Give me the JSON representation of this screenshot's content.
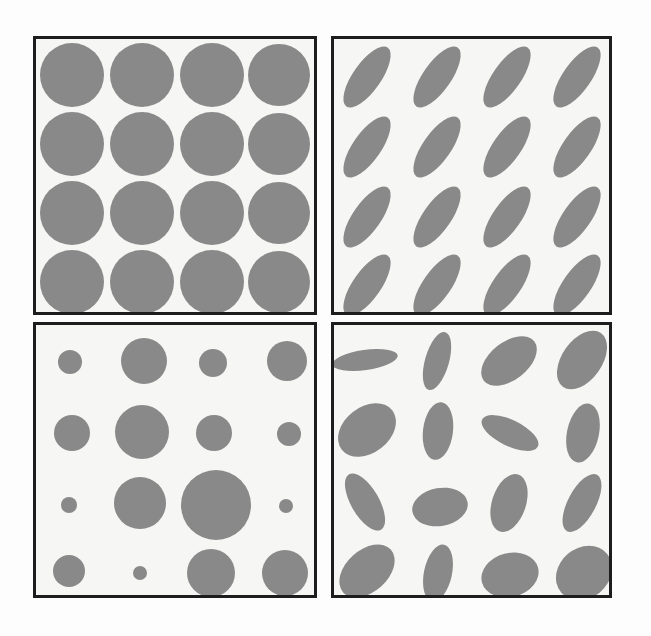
{
  "figure": {
    "width": 651,
    "height": 636,
    "page_background": "#fdfdfd",
    "panel_background": "#f6f6f4",
    "panel_border_color": "#1d1d1d",
    "panel_border_width": 3,
    "shape_fill": "#898989"
  },
  "panels": [
    {
      "id": "panel-uniform-circles",
      "label": "Uniform circles",
      "position": "top-left",
      "x": 33,
      "y": 36,
      "width": 284,
      "height": 279,
      "shape_type": "circle",
      "variation": "none",
      "rows": 4,
      "cols": 4,
      "count": 16,
      "shapes": [
        {
          "cx": 36,
          "cy": 36,
          "rx": 32,
          "ry": 32,
          "angle": 0
        },
        {
          "cx": 106,
          "cy": 36,
          "rx": 32,
          "ry": 32,
          "angle": 0
        },
        {
          "cx": 176,
          "cy": 36,
          "rx": 32,
          "ry": 32,
          "angle": 0
        },
        {
          "cx": 243,
          "cy": 36,
          "rx": 31,
          "ry": 31,
          "angle": 0
        },
        {
          "cx": 36,
          "cy": 105,
          "rx": 32,
          "ry": 32,
          "angle": 0
        },
        {
          "cx": 106,
          "cy": 105,
          "rx": 32,
          "ry": 32,
          "angle": 0
        },
        {
          "cx": 176,
          "cy": 105,
          "rx": 32,
          "ry": 32,
          "angle": 0
        },
        {
          "cx": 243,
          "cy": 105,
          "rx": 31,
          "ry": 31,
          "angle": 0
        },
        {
          "cx": 36,
          "cy": 174,
          "rx": 32,
          "ry": 32,
          "angle": 0
        },
        {
          "cx": 106,
          "cy": 174,
          "rx": 32,
          "ry": 32,
          "angle": 0
        },
        {
          "cx": 176,
          "cy": 174,
          "rx": 32,
          "ry": 32,
          "angle": 0
        },
        {
          "cx": 243,
          "cy": 174,
          "rx": 31,
          "ry": 31,
          "angle": 0
        },
        {
          "cx": 36,
          "cy": 243,
          "rx": 32,
          "ry": 32,
          "angle": 0
        },
        {
          "cx": 106,
          "cy": 243,
          "rx": 32,
          "ry": 32,
          "angle": 0
        },
        {
          "cx": 176,
          "cy": 243,
          "rx": 32,
          "ry": 32,
          "angle": 0
        },
        {
          "cx": 243,
          "cy": 243,
          "rx": 31,
          "ry": 31,
          "angle": 0
        }
      ]
    },
    {
      "id": "panel-uniform-ellipses",
      "label": "Uniform ellipses, common orientation",
      "position": "top-right",
      "x": 331,
      "y": 36,
      "width": 281,
      "height": 279,
      "shape_type": "ellipse",
      "variation": "none",
      "rows": 4,
      "cols": 4,
      "count": 16,
      "common_angle": -55,
      "shapes": [
        {
          "cx": 33,
          "cy": 38,
          "rx": 36,
          "ry": 14,
          "angle": -55
        },
        {
          "cx": 103,
          "cy": 38,
          "rx": 36,
          "ry": 14,
          "angle": -55
        },
        {
          "cx": 173,
          "cy": 38,
          "rx": 36,
          "ry": 14,
          "angle": -55
        },
        {
          "cx": 243,
          "cy": 38,
          "rx": 36,
          "ry": 14,
          "angle": -55
        },
        {
          "cx": 33,
          "cy": 108,
          "rx": 36,
          "ry": 14,
          "angle": -55
        },
        {
          "cx": 103,
          "cy": 108,
          "rx": 36,
          "ry": 14,
          "angle": -55
        },
        {
          "cx": 173,
          "cy": 108,
          "rx": 36,
          "ry": 14,
          "angle": -55
        },
        {
          "cx": 243,
          "cy": 108,
          "rx": 36,
          "ry": 14,
          "angle": -55
        },
        {
          "cx": 33,
          "cy": 178,
          "rx": 36,
          "ry": 14,
          "angle": -55
        },
        {
          "cx": 103,
          "cy": 178,
          "rx": 36,
          "ry": 14,
          "angle": -55
        },
        {
          "cx": 173,
          "cy": 178,
          "rx": 36,
          "ry": 14,
          "angle": -55
        },
        {
          "cx": 243,
          "cy": 178,
          "rx": 36,
          "ry": 14,
          "angle": -55
        },
        {
          "cx": 33,
          "cy": 246,
          "rx": 36,
          "ry": 14,
          "angle": -55
        },
        {
          "cx": 103,
          "cy": 246,
          "rx": 36,
          "ry": 14,
          "angle": -55
        },
        {
          "cx": 173,
          "cy": 246,
          "rx": 36,
          "ry": 14,
          "angle": -55
        },
        {
          "cx": 243,
          "cy": 246,
          "rx": 36,
          "ry": 14,
          "angle": -55
        }
      ]
    },
    {
      "id": "panel-varied-circles",
      "label": "Circles with varied size",
      "position": "bottom-left",
      "x": 33,
      "y": 322,
      "width": 284,
      "height": 276,
      "shape_type": "circle",
      "variation": "size",
      "rows": 4,
      "cols": 4,
      "count": 16,
      "shapes": [
        {
          "cx": 34,
          "cy": 37,
          "rx": 12,
          "ry": 12,
          "angle": 0
        },
        {
          "cx": 108,
          "cy": 36,
          "rx": 23,
          "ry": 23,
          "angle": 0
        },
        {
          "cx": 177,
          "cy": 38,
          "rx": 14,
          "ry": 14,
          "angle": 0
        },
        {
          "cx": 251,
          "cy": 36,
          "rx": 20,
          "ry": 20,
          "angle": 0
        },
        {
          "cx": 36,
          "cy": 108,
          "rx": 18,
          "ry": 18,
          "angle": 0
        },
        {
          "cx": 106,
          "cy": 107,
          "rx": 27,
          "ry": 27,
          "angle": 0
        },
        {
          "cx": 178,
          "cy": 108,
          "rx": 18,
          "ry": 18,
          "angle": 0
        },
        {
          "cx": 253,
          "cy": 109,
          "rx": 12,
          "ry": 12,
          "angle": 0
        },
        {
          "cx": 33,
          "cy": 180,
          "rx": 8,
          "ry": 8,
          "angle": 0
        },
        {
          "cx": 104,
          "cy": 178,
          "rx": 26,
          "ry": 26,
          "angle": 0
        },
        {
          "cx": 180,
          "cy": 180,
          "rx": 35,
          "ry": 35,
          "angle": 0
        },
        {
          "cx": 250,
          "cy": 181,
          "rx": 7,
          "ry": 7,
          "angle": 0
        },
        {
          "cx": 33,
          "cy": 246,
          "rx": 16,
          "ry": 16,
          "angle": 0
        },
        {
          "cx": 104,
          "cy": 248,
          "rx": 7,
          "ry": 7,
          "angle": 0
        },
        {
          "cx": 175,
          "cy": 248,
          "rx": 24,
          "ry": 24,
          "angle": 0
        },
        {
          "cx": 249,
          "cy": 248,
          "rx": 23,
          "ry": 23,
          "angle": 0
        }
      ]
    },
    {
      "id": "panel-varied-ellipses",
      "label": "Ellipses with varied orientation and aspect ratio",
      "position": "bottom-right",
      "x": 331,
      "y": 322,
      "width": 281,
      "height": 276,
      "shape_type": "ellipse",
      "variation": "orientation-and-aspect",
      "rows": 4,
      "cols": 4,
      "count": 16,
      "shapes": [
        {
          "cx": 31,
          "cy": 35,
          "rx": 33,
          "ry": 10,
          "angle": -8
        },
        {
          "cx": 103,
          "cy": 36,
          "rx": 30,
          "ry": 12,
          "angle": -74
        },
        {
          "cx": 175,
          "cy": 36,
          "rx": 32,
          "ry": 19,
          "angle": -38
        },
        {
          "cx": 248,
          "cy": 35,
          "rx": 33,
          "ry": 20,
          "angle": -55
        },
        {
          "cx": 33,
          "cy": 105,
          "rx": 32,
          "ry": 23,
          "angle": -38
        },
        {
          "cx": 104,
          "cy": 106,
          "rx": 29,
          "ry": 15,
          "angle": -83
        },
        {
          "cx": 176,
          "cy": 108,
          "rx": 31,
          "ry": 13,
          "angle": 26
        },
        {
          "cx": 249,
          "cy": 108,
          "rx": 30,
          "ry": 16,
          "angle": -78
        },
        {
          "cx": 31,
          "cy": 177,
          "rx": 32,
          "ry": 14,
          "angle": 60
        },
        {
          "cx": 106,
          "cy": 182,
          "rx": 28,
          "ry": 19,
          "angle": -10
        },
        {
          "cx": 175,
          "cy": 178,
          "rx": 30,
          "ry": 17,
          "angle": -72
        },
        {
          "cx": 248,
          "cy": 178,
          "rx": 32,
          "ry": 14,
          "angle": -62
        },
        {
          "cx": 33,
          "cy": 246,
          "rx": 32,
          "ry": 21,
          "angle": -42
        },
        {
          "cx": 104,
          "cy": 248,
          "rx": 29,
          "ry": 14,
          "angle": -78
        },
        {
          "cx": 176,
          "cy": 250,
          "rx": 29,
          "ry": 22,
          "angle": -15
        },
        {
          "cx": 250,
          "cy": 248,
          "rx": 30,
          "ry": 25,
          "angle": -40
        }
      ]
    }
  ]
}
